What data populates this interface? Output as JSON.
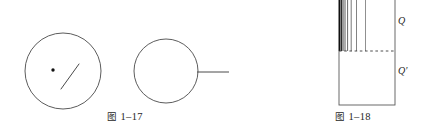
{
  "page": {
    "background_color": "#ffffff",
    "ink_color": "#3a3a3a",
    "width": 426,
    "height": 135
  },
  "figures": [
    {
      "id": "fig-1-17",
      "caption_label": "图",
      "caption_number": "1–17",
      "elements": {
        "left_circle": {
          "name": "circle-with-center-dot",
          "cx": 63,
          "cy": 71,
          "r": 38,
          "center_dot_r": 1.6,
          "radius_line": {
            "x1": 61,
            "y1": 89,
            "x2": 79,
            "y2": 64
          }
        },
        "right_circle": {
          "name": "circle-with-tangent-line",
          "cx": 166,
          "cy": 71,
          "r": 32,
          "lead_line": {
            "x1": 197,
            "y1": 72,
            "x2": 229,
            "y2": 72
          }
        }
      }
    },
    {
      "id": "fig-1-18",
      "caption_label": "图",
      "caption_number": "1–18",
      "labels": {
        "upper": "Q",
        "lower": "Q′"
      },
      "elements": {
        "rect": {
          "name": "column-outline",
          "x": 89,
          "y": 0,
          "width": 56,
          "height": 105
        },
        "divider": {
          "name": "dashed-divider",
          "y": 51,
          "x1": 89,
          "x2": 145,
          "style": "dashed"
        },
        "hatch_lines": {
          "name": "vertical-hatch-lines",
          "count": 8,
          "top": 0,
          "bottom": 51,
          "x_positions": [
            89.5,
            91,
            92.5,
            94.5,
            97,
            100.5,
            106,
            115
          ],
          "widths": [
            1.6,
            1.2,
            1.0,
            0.9,
            0.8,
            0.8,
            0.7,
            0.7
          ]
        }
      }
    }
  ]
}
